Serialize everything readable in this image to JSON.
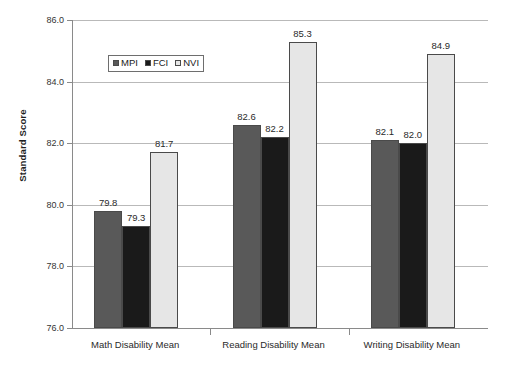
{
  "chart_data": {
    "type": "bar",
    "title": "",
    "subtitle": "",
    "xlabel": "",
    "ylabel": "Standard Score",
    "ylim": [
      76.0,
      86.0
    ],
    "ytick_step": 2.0,
    "ytick_labels": [
      "86.0",
      "84.0",
      "82.0",
      "80.0",
      "78.0",
      "76.0"
    ],
    "ytick_values": [
      86.0,
      84.0,
      82.0,
      80.0,
      78.0,
      76.0
    ],
    "grid": "horizontal",
    "legend_position": "inside-upper-left",
    "categories": [
      "Math Disability Mean",
      "Reading Disability Mean",
      "Writing Disability Mean"
    ],
    "series": [
      {
        "name": "MPI",
        "color": "#595959",
        "values": [
          79.8,
          79.3,
          82.1
        ]
      },
      {
        "name": "FCI",
        "color": "#1a1a1a",
        "values": [
          79.3,
          82.2,
          82.0
        ]
      },
      {
        "name": "NVI",
        "color": "#e6e6e6",
        "values": [
          81.7,
          85.3,
          84.9
        ]
      }
    ],
    "groups": [
      {
        "category": "Math Disability Mean",
        "bars": [
          {
            "series": "MPI",
            "value": 79.8,
            "label": "79.8"
          },
          {
            "series": "FCI",
            "value": 79.3,
            "label": "79.3"
          },
          {
            "series": "NVI",
            "value": 81.7,
            "label": "81.7"
          }
        ]
      },
      {
        "category": "Reading Disability Mean",
        "bars": [
          {
            "series": "MPI",
            "value": 82.6,
            "label": "82.6"
          },
          {
            "series": "FCI",
            "value": 82.2,
            "label": "82.2"
          },
          {
            "series": "NVI",
            "value": 85.3,
            "label": "85.3"
          }
        ]
      },
      {
        "category": "Writing Disability Mean",
        "bars": [
          {
            "series": "MPI",
            "value": 82.1,
            "label": "82.1"
          },
          {
            "series": "FCI",
            "value": 82.0,
            "label": "82.0"
          },
          {
            "series": "NVI",
            "value": 84.9,
            "label": "84.9"
          }
        ]
      }
    ]
  },
  "legend": {
    "entries": [
      {
        "label": "MPI",
        "color": "#595959"
      },
      {
        "label": "FCI",
        "color": "#1a1a1a"
      },
      {
        "label": "NVI",
        "color": "#e6e6e6"
      }
    ]
  },
  "axes": {
    "y_title": "Standard Score"
  },
  "colors": {
    "background": "#ffffff",
    "axis": "#8a8a8a",
    "gridline": "#b9b9b9",
    "text": "#2a2a2a",
    "bar_outline": "#4a4a4a"
  }
}
